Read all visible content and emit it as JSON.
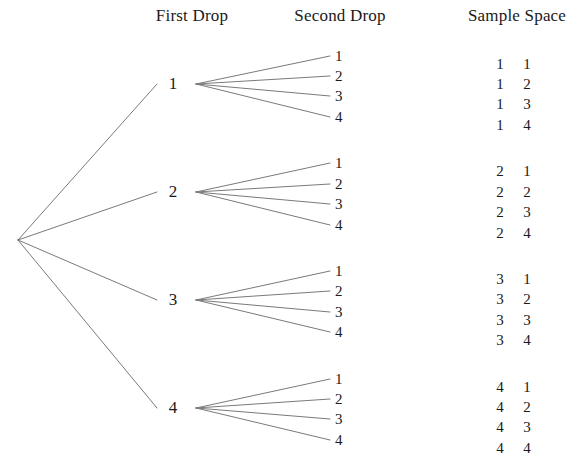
{
  "diagram": {
    "background_color": "#ffffff",
    "line_color": "#7a7a7a",
    "text_color": "#1a1a1a"
  },
  "headers": [
    {
      "label": "First Drop",
      "x": 192,
      "y": 6
    },
    {
      "label": "Second Drop",
      "x": 340,
      "y": 6
    },
    {
      "label": "Sample Space",
      "x": 517,
      "y": 6
    }
  ],
  "root": {
    "x": 18,
    "y": 240
  },
  "branch_x": 196,
  "leaf_end_x": 330,
  "leaf_label_x": 335,
  "outcome_first_x": 500,
  "outcome_second_x": 527,
  "groups": [
    {
      "first": "1",
      "node_x": 173,
      "node_y": 84,
      "leaves": [
        {
          "label": "1",
          "y": 56,
          "outcome_first": "1",
          "outcome_second": "1"
        },
        {
          "label": "2",
          "y": 76,
          "outcome_first": "1",
          "outcome_second": "2"
        },
        {
          "label": "3",
          "y": 96,
          "outcome_first": "1",
          "outcome_second": "3"
        },
        {
          "label": "4",
          "y": 117,
          "outcome_first": "1",
          "outcome_second": "4"
        }
      ]
    },
    {
      "first": "2",
      "node_x": 173,
      "node_y": 192,
      "leaves": [
        {
          "label": "1",
          "y": 163,
          "outcome_first": "2",
          "outcome_second": "1"
        },
        {
          "label": "2",
          "y": 184,
          "outcome_first": "2",
          "outcome_second": "2"
        },
        {
          "label": "3",
          "y": 204,
          "outcome_first": "2",
          "outcome_second": "3"
        },
        {
          "label": "4",
          "y": 225,
          "outcome_first": "2",
          "outcome_second": "4"
        }
      ]
    },
    {
      "first": "3",
      "node_x": 173,
      "node_y": 300,
      "leaves": [
        {
          "label": "1",
          "y": 271,
          "outcome_first": "3",
          "outcome_second": "1"
        },
        {
          "label": "2",
          "y": 291,
          "outcome_first": "3",
          "outcome_second": "2"
        },
        {
          "label": "3",
          "y": 312,
          "outcome_first": "3",
          "outcome_second": "3"
        },
        {
          "label": "4",
          "y": 332,
          "outcome_first": "3",
          "outcome_second": "4"
        }
      ]
    },
    {
      "first": "4",
      "node_x": 173,
      "node_y": 408,
      "leaves": [
        {
          "label": "1",
          "y": 379,
          "outcome_first": "4",
          "outcome_second": "1"
        },
        {
          "label": "2",
          "y": 399,
          "outcome_first": "4",
          "outcome_second": "2"
        },
        {
          "label": "3",
          "y": 419,
          "outcome_first": "4",
          "outcome_second": "3"
        },
        {
          "label": "4",
          "y": 440,
          "outcome_first": "4",
          "outcome_second": "4"
        }
      ]
    }
  ]
}
